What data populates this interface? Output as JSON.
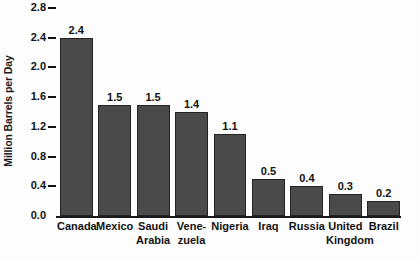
{
  "chart_data": {
    "type": "bar",
    "title": "",
    "xlabel": "",
    "ylabel": "Million Barrels per Day",
    "ylim": [
      0.0,
      2.8
    ],
    "grid": false,
    "legend": null,
    "ytick_labels": [
      "2.8",
      "2.4",
      "2.0",
      "1.6",
      "1.2",
      "0.8",
      "0.4",
      "0.0"
    ],
    "ytick_values": [
      2.8,
      2.4,
      2.0,
      1.6,
      1.2,
      0.8,
      0.4,
      0.0
    ],
    "categories": [
      "Canada",
      "Mexico",
      "Saudi Arabia",
      "Venezuela",
      "Nigeria",
      "Iraq",
      "Russia",
      "United Kingdom",
      "Brazil"
    ],
    "category_label_lines": [
      [
        "Canada"
      ],
      [
        "Mexico"
      ],
      [
        "Saudi",
        "Arabia"
      ],
      [
        "Vene-",
        "zuela"
      ],
      [
        "Nigeria"
      ],
      [
        "Iraq"
      ],
      [
        "Russia"
      ],
      [
        "United",
        "Kingdom"
      ],
      [
        "Brazil"
      ]
    ],
    "values": [
      2.4,
      1.5,
      1.5,
      1.4,
      1.1,
      0.5,
      0.4,
      0.3,
      0.2
    ],
    "value_labels": [
      "2.4",
      "1.5",
      "1.5",
      "1.4",
      "1.1",
      "0.5",
      "0.4",
      "0.3",
      "0.2"
    ],
    "bar_color": "#4a4a4a",
    "bar_edge_color": "#232323",
    "axis_color": "#1a1a1a",
    "background_color": "#fdfdfd"
  }
}
